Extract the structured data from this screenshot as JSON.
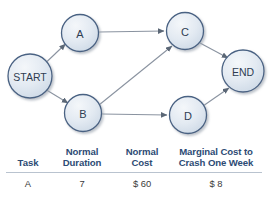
{
  "figure": {
    "type": "project-network-crash-cost-figure"
  },
  "diagram": {
    "type": "activity-on-node-network",
    "nodes": [
      {
        "id": "start",
        "label": "START",
        "cx": 30,
        "cy": 76,
        "r": 22,
        "kind": "terminal"
      },
      {
        "id": "a",
        "label": "A",
        "cx": 80,
        "cy": 33,
        "r": 18.5,
        "kind": "task"
      },
      {
        "id": "b",
        "label": "B",
        "cx": 83,
        "cy": 113,
        "r": 18.5,
        "kind": "task"
      },
      {
        "id": "c",
        "label": "C",
        "cx": 185,
        "cy": 31,
        "r": 18.5,
        "kind": "task"
      },
      {
        "id": "d",
        "label": "D",
        "cx": 188,
        "cy": 115,
        "r": 18.5,
        "kind": "task"
      },
      {
        "id": "end",
        "label": "END",
        "cx": 243,
        "cy": 71,
        "r": 21,
        "kind": "terminal"
      }
    ],
    "edges": [
      {
        "from": "start",
        "to": "a"
      },
      {
        "from": "start",
        "to": "b"
      },
      {
        "from": "a",
        "to": "c"
      },
      {
        "from": "b",
        "to": "c"
      },
      {
        "from": "b",
        "to": "d"
      },
      {
        "from": "c",
        "to": "end"
      },
      {
        "from": "d",
        "to": "end"
      }
    ],
    "colors": {
      "node_fill_light": "#eef2f7",
      "node_fill_dark": "#c8d4e2",
      "node_stroke": "#4a6283",
      "edge": "#8a93a0",
      "label_text": "#2e3d52",
      "shadow": "#c9cdd3"
    }
  },
  "table": {
    "headers": {
      "task": "Task",
      "normal_duration_line1": "Normal",
      "normal_duration_line2": "Duration",
      "normal_cost_line1": "Normal",
      "normal_cost_line2": "Cost",
      "marginal_line1": "Marginal Cost to",
      "marginal_line2": "Crash One Week"
    },
    "rows": [
      {
        "task": "A",
        "normal_duration": "7",
        "normal_cost": "$ 60",
        "marginal_crash_cost": "$ 8"
      }
    ],
    "colors": {
      "header_text": "#2d4b74",
      "body_text": "#3a3a3a",
      "rule": "#b9c3cf"
    }
  }
}
